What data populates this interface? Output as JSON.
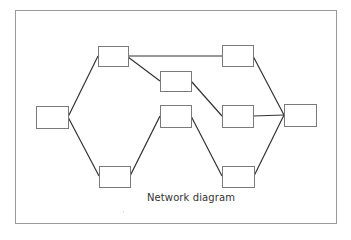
{
  "diagram": {
    "caption": "Network diagram",
    "colors": {
      "frame": "#9a9a9a",
      "node_border": "#7a7a7a",
      "node_fill": "#ffffff",
      "edge": "#333333",
      "caption": "#333333"
    },
    "nodes": [
      {
        "id": "A",
        "x": 36,
        "y": 106,
        "w": 32,
        "h": 22
      },
      {
        "id": "B",
        "x": 98,
        "y": 46,
        "w": 30,
        "h": 20
      },
      {
        "id": "C",
        "x": 160,
        "y": 71,
        "w": 31,
        "h": 20
      },
      {
        "id": "D",
        "x": 160,
        "y": 105,
        "w": 31,
        "h": 22
      },
      {
        "id": "E",
        "x": 99,
        "y": 166,
        "w": 31,
        "h": 21
      },
      {
        "id": "F",
        "x": 222,
        "y": 45,
        "w": 31,
        "h": 21
      },
      {
        "id": "G",
        "x": 222,
        "y": 105,
        "w": 31,
        "h": 22
      },
      {
        "id": "H",
        "x": 222,
        "y": 166,
        "w": 32,
        "h": 21
      },
      {
        "id": "I",
        "x": 284,
        "y": 104,
        "w": 32,
        "h": 22
      }
    ],
    "edges": [
      {
        "from": "A",
        "to": "B",
        "x1": 68,
        "y1": 117,
        "x2": 98,
        "y2": 56
      },
      {
        "from": "A",
        "to": "E",
        "x1": 68,
        "y1": 117,
        "x2": 99,
        "y2": 176
      },
      {
        "from": "B",
        "to": "F",
        "x1": 128,
        "y1": 56,
        "x2": 222,
        "y2": 56
      },
      {
        "from": "B",
        "to": "C",
        "x1": 128,
        "y1": 57,
        "x2": 160,
        "y2": 81
      },
      {
        "from": "C",
        "to": "G",
        "x1": 191,
        "y1": 81,
        "x2": 222,
        "y2": 116
      },
      {
        "from": "E",
        "to": "D",
        "x1": 130,
        "y1": 176,
        "x2": 160,
        "y2": 116
      },
      {
        "from": "D",
        "to": "H",
        "x1": 191,
        "y1": 116,
        "x2": 222,
        "y2": 176
      },
      {
        "from": "F",
        "to": "I",
        "x1": 253,
        "y1": 56,
        "x2": 284,
        "y2": 115
      },
      {
        "from": "G",
        "to": "I",
        "x1": 253,
        "y1": 116,
        "x2": 284,
        "y2": 115
      },
      {
        "from": "H",
        "to": "I",
        "x1": 254,
        "y1": 176,
        "x2": 284,
        "y2": 115
      }
    ]
  }
}
